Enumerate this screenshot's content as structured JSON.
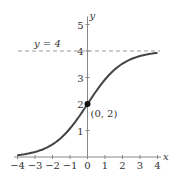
{
  "chart_data": {
    "type": "line",
    "title": "",
    "xlabel": "x",
    "ylabel": "y",
    "xlim": [
      -4,
      4
    ],
    "ylim": [
      0,
      5
    ],
    "x_ticks": [
      "−4",
      "−3",
      "−2",
      "−1",
      "0",
      "1",
      "2",
      "3",
      "4"
    ],
    "y_ticks": [
      "1",
      "2",
      "3",
      "4",
      "5"
    ],
    "series": [
      {
        "name": "y = 4/(1+e^(-x))",
        "x": [
          -4,
          -3,
          -2,
          -1,
          0,
          1,
          2,
          3,
          4
        ],
        "values": [
          0.07,
          0.19,
          0.48,
          1.08,
          2.0,
          2.92,
          3.52,
          3.81,
          3.93
        ]
      }
    ],
    "asymptote": {
      "label": "y = 4",
      "y": 4,
      "style": "dashed"
    },
    "point": {
      "label": "(0, 2)",
      "x": 0,
      "y": 2
    },
    "grid": false
  }
}
